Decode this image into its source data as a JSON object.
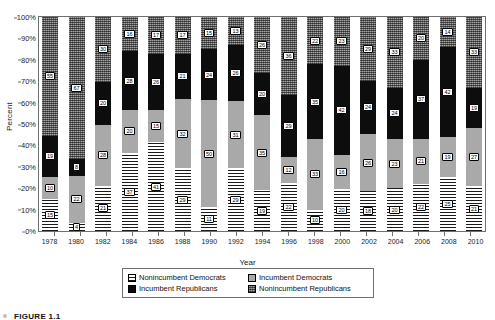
{
  "chart_data": {
    "type": "bar",
    "subtype": "stacked-100-percent",
    "title": "",
    "xlabel": "Year",
    "ylabel": "Percent",
    "ylim": [
      0,
      100
    ],
    "ytick_labels": [
      "0%",
      "10%",
      "20%",
      "30%",
      "40%",
      "50%",
      "60%",
      "70%",
      "80%",
      "90%",
      "100%"
    ],
    "ytick_values": [
      0,
      10,
      20,
      30,
      40,
      50,
      60,
      70,
      80,
      90,
      100
    ],
    "grid": false,
    "legend_position": "bottom",
    "categories": [
      "1978",
      "1980",
      "1982",
      "1984",
      "1986",
      "1988",
      "1990",
      "1992",
      "1994",
      "1996",
      "1998",
      "2000",
      "2002",
      "2004",
      "2006",
      "2008",
      "2010"
    ],
    "series": [
      {
        "name": "Nonincumbent Democrats",
        "key": "nid",
        "pattern": "horizontal-line-hatch",
        "color": "#ffffff",
        "values": [
          15,
          4,
          21,
          37,
          41,
          29,
          11,
          29,
          19,
          22,
          10,
          20,
          18,
          20,
          22,
          25,
          21
        ]
      },
      {
        "name": "Incumbent Democrats",
        "key": "id",
        "pattern": "solid-light-grey",
        "color": "#a9a9a9",
        "values": [
          10,
          22,
          28,
          20,
          15,
          32,
          50,
          31,
          35,
          12,
          33,
          16,
          26,
          23,
          21,
          19,
          27
        ]
      },
      {
        "name": "Incumbent Republicans",
        "key": "ir",
        "pattern": "solid-black",
        "color": "#0d0d0d",
        "values": [
          19,
          8,
          20,
          28,
          26,
          21,
          24,
          26,
          20,
          29,
          35,
          42,
          24,
          24,
          37,
          42,
          19
        ]
      },
      {
        "name": "Nonincumbent Republicans",
        "key": "nir",
        "pattern": "dark-grey-checker",
        "color": "#6e6e6e",
        "values": [
          55,
          67,
          30,
          16,
          17,
          17,
          15,
          13,
          26,
          36,
          22,
          23,
          29,
          33,
          20,
          14,
          33
        ]
      }
    ]
  },
  "caption": "FIGURE 1.1"
}
